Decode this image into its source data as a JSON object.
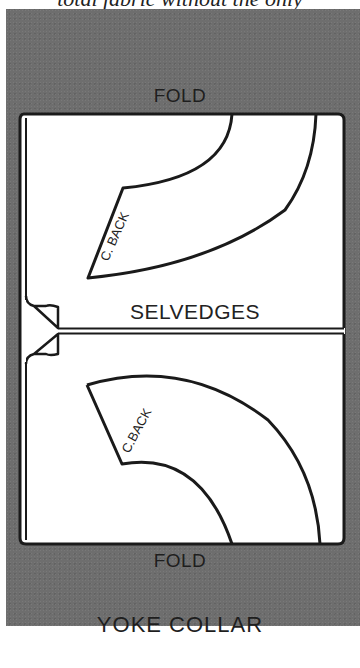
{
  "caption": "total fabric without the only",
  "diagram": {
    "title": "YOKE COLLAR",
    "labels": {
      "fold_top": "FOLD",
      "fold_bottom": "FOLD",
      "selvedges": "SELVEDGES",
      "center_back_top": "C. BACK",
      "center_back_bottom": "C.BACK"
    },
    "pieces": [
      {
        "name": "yoke-collar-top-layer",
        "position": "upper",
        "orientation": "opens-up"
      },
      {
        "name": "yoke-collar-bottom-layer",
        "position": "lower",
        "orientation": "opens-down"
      }
    ],
    "colors": {
      "background_panel": "#6e6e6e",
      "fabric": "#ffffff",
      "outline": "#1a1a1a"
    }
  }
}
